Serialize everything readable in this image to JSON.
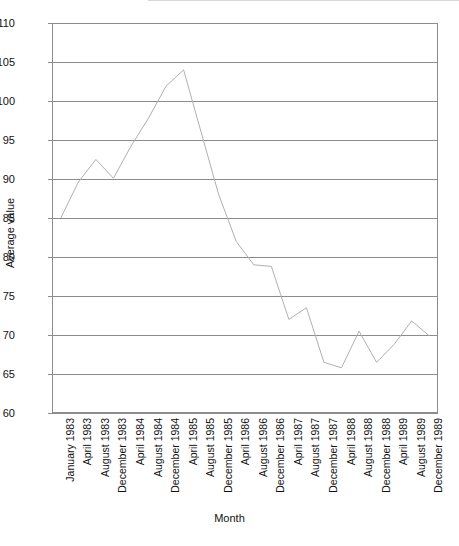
{
  "chart_data": {
    "type": "line",
    "title": "",
    "xlabel": "Month",
    "ylabel": "Average value",
    "ylim": [
      60,
      110
    ],
    "ytick_step": 5,
    "yticks": [
      60,
      65,
      70,
      75,
      80,
      85,
      90,
      95,
      100,
      105,
      110
    ],
    "grid": "horizontal",
    "legend": "none",
    "line_color": "#b0b0b0",
    "axis_color": "#8c8c8c",
    "categories": [
      "January 1983",
      "April 1983",
      "August 1983",
      "December 1983",
      "April 1984",
      "August 1984",
      "December 1984",
      "April 1985",
      "August 1985",
      "December 1985",
      "April 1986",
      "August 1986",
      "December 1986",
      "April 1987",
      "August 1987",
      "December 1987",
      "April 1988",
      "August 1988",
      "December 1988",
      "April 1989",
      "August 1989",
      "December 1989"
    ],
    "series": [
      {
        "name": "Average value",
        "values": [
          85.0,
          89.6,
          92.5,
          90.1,
          94.2,
          97.8,
          101.9,
          104.0,
          96.0,
          88.0,
          82.0,
          79.0,
          78.8,
          72.0,
          73.5,
          66.5,
          65.8,
          70.5,
          66.5,
          68.8,
          71.8,
          69.9
        ]
      }
    ]
  }
}
